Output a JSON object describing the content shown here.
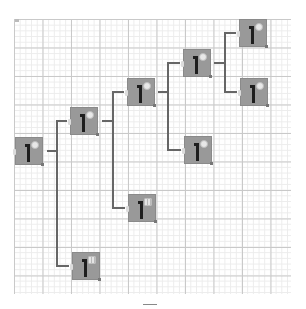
{
  "diagram": {
    "type": "tree",
    "orientation": "left-to-right",
    "colors": {
      "node_fill": "#999999",
      "node_icon": "#1e1e1e",
      "connector": "#666666",
      "grid_major": "#c9c9c9",
      "grid_minor": "#ececec",
      "background": "#ffffff"
    },
    "nodes": [
      {
        "id": "n1",
        "x": 15,
        "y": 137,
        "badge": "round",
        "label": ""
      },
      {
        "id": "n2",
        "x": 70,
        "y": 107,
        "badge": "round",
        "label": ""
      },
      {
        "id": "n3",
        "x": 72,
        "y": 252,
        "badge": "square",
        "label": ""
      },
      {
        "id": "n4",
        "x": 127,
        "y": 78,
        "badge": "round",
        "label": ""
      },
      {
        "id": "n5",
        "x": 128,
        "y": 194,
        "badge": "square",
        "label": ""
      },
      {
        "id": "n6",
        "x": 183,
        "y": 49,
        "badge": "round",
        "label": ""
      },
      {
        "id": "n7",
        "x": 184,
        "y": 136,
        "badge": "round",
        "label": ""
      },
      {
        "id": "n8",
        "x": 239,
        "y": 19,
        "badge": "round",
        "label": ""
      },
      {
        "id": "n9",
        "x": 240,
        "y": 78,
        "badge": "round",
        "label": ""
      }
    ],
    "edges": [
      {
        "from": "n1",
        "to": "n2"
      },
      {
        "from": "n1",
        "to": "n3"
      },
      {
        "from": "n2",
        "to": "n4"
      },
      {
        "from": "n2",
        "to": "n5"
      },
      {
        "from": "n4",
        "to": "n6"
      },
      {
        "from": "n4",
        "to": "n7"
      },
      {
        "from": "n6",
        "to": "n8"
      },
      {
        "from": "n6",
        "to": "n9"
      }
    ]
  }
}
